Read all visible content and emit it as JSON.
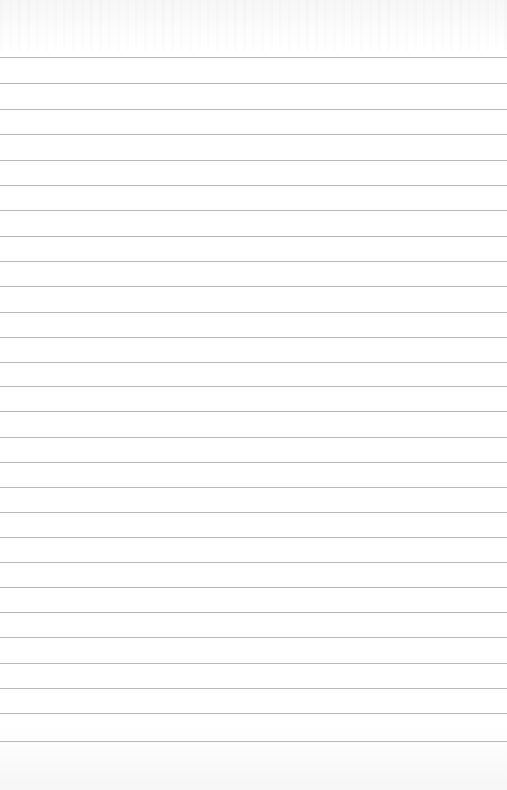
{
  "page": {
    "type": "lined-paper",
    "background_color": "#ffffff",
    "line_color": "#b9b9b9",
    "line_thickness_px": 1,
    "lines_y": [
      57,
      83,
      109,
      134,
      160,
      185,
      210,
      236,
      261,
      286,
      312,
      337,
      362,
      386,
      411,
      437,
      462,
      487,
      512,
      537,
      562,
      587,
      612,
      637,
      663,
      688,
      713,
      741
    ]
  }
}
